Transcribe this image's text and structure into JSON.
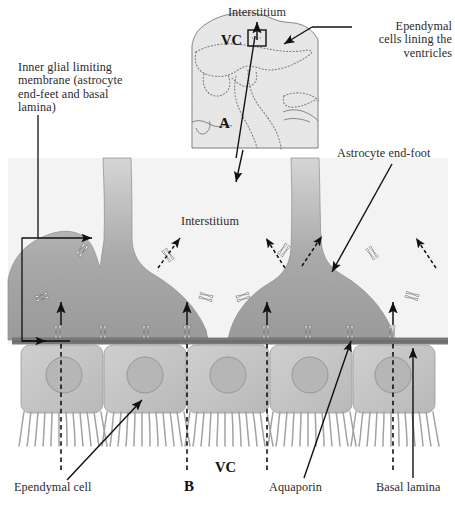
{
  "figure": {
    "panels": [
      {
        "letter": "A",
        "caption": "Sagittal brain section showing ventricular system"
      },
      {
        "letter": "B",
        "caption": "Detail of ependymal layer and inner glial limiting membrane"
      }
    ]
  },
  "panel_a": {
    "letter": "A",
    "interstitium_label": "Interstitium",
    "vc_label": "VC",
    "callout_box": "region-of-interest-box"
  },
  "panel_b": {
    "letter": "B",
    "interstitium_label": "Interstitium",
    "vc_label": "VC"
  },
  "labels": {
    "ependymal_cells_lining": "Ependymal\ncells lining the\nventricles",
    "inner_glial_limiting_membrane": "Inner glial limiting\nmembrane (astrocyte\nend-feet and basal\nlamina)",
    "astrocyte_end_foot": "Astrocyte end-foot",
    "ependymal_cell": "Ependymal cell",
    "aquaporin": "Aquaporin",
    "basal_lamina": "Basal lamina"
  },
  "icons": {
    "aquaporin_channel": "aquaporin-channel-icon",
    "water_flux_arrow": "dashed-flux-arrow-icon",
    "leader_arrow": "leader-arrow-icon",
    "cilium": "cilium-icon",
    "nucleus": "nucleus-icon"
  },
  "colors": {
    "astrocyte_fill_dark": "#9d9d9d",
    "astrocyte_fill_light": "#cfcfcf",
    "ependymal_fill": "#c5c5c5",
    "ependymal_nucleus": "#b4b4b4",
    "basal_lamina": "#6e6e6e",
    "interstitium_bg": "#f4f4f4",
    "brain_fill": "#e6e6e6",
    "outline": "#5a5a5a",
    "text": "#2b2b2b",
    "aquaporin_white": "#ffffff"
  },
  "counts": {
    "astrocyte_end_feet": 3,
    "ependymal_cells": 5,
    "aquaporins_on_basal_lamina": 8,
    "aquaporins_on_astrocyte_apical": 6
  }
}
